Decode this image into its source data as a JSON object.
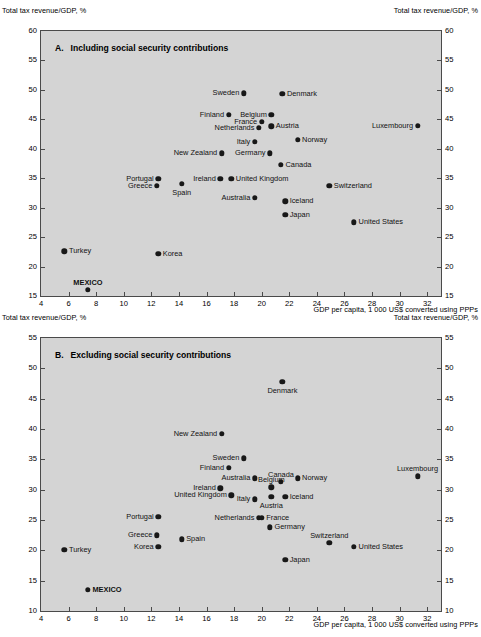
{
  "figure": {
    "y_axis_label": "Total tax revenue/GDP, %",
    "x_axis_label": "GDP per capita, 1 000 US$ converted using PPPs"
  },
  "chart_data": [
    {
      "type": "scatter",
      "panel": "A",
      "panel_letter": "A.",
      "title": "Including social security contributions",
      "xlabel": "GDP per capita, 1 000 US$ converted using PPPs",
      "ylabel": "Total tax revenue/GDP, %",
      "xlim": [
        4,
        33
      ],
      "ylim": [
        15,
        60
      ],
      "xticks": [
        4,
        6,
        8,
        10,
        12,
        14,
        16,
        18,
        20,
        22,
        24,
        26,
        28,
        30,
        32
      ],
      "yticks": [
        15,
        20,
        25,
        30,
        35,
        40,
        45,
        50,
        55,
        60
      ],
      "grid": false,
      "legend": "none",
      "points": [
        {
          "name": "Sweden",
          "x": 18.7,
          "y": 49.4,
          "label_side": "left"
        },
        {
          "name": "Denmark",
          "x": 21.5,
          "y": 49.3,
          "label_side": "right"
        },
        {
          "name": "Finland",
          "x": 17.6,
          "y": 45.8,
          "label_side": "left"
        },
        {
          "name": "Belgium",
          "x": 20.7,
          "y": 45.8,
          "label_side": "left"
        },
        {
          "name": "France",
          "x": 20.0,
          "y": 44.6,
          "label_side": "left"
        },
        {
          "name": "Netherlands",
          "x": 19.8,
          "y": 43.6,
          "label_side": "left"
        },
        {
          "name": "Austria",
          "x": 20.7,
          "y": 43.8,
          "label_side": "right"
        },
        {
          "name": "Luxembourg",
          "x": 31.3,
          "y": 43.9,
          "label_side": "left"
        },
        {
          "name": "Italy",
          "x": 19.5,
          "y": 41.2,
          "label_side": "left"
        },
        {
          "name": "Norway",
          "x": 22.6,
          "y": 41.5,
          "label_side": "right"
        },
        {
          "name": "New Zealand",
          "x": 17.1,
          "y": 39.2,
          "label_side": "left"
        },
        {
          "name": "Germany",
          "x": 20.6,
          "y": 39.2,
          "label_side": "left"
        },
        {
          "name": "Canada",
          "x": 21.4,
          "y": 37.3,
          "label_side": "right"
        },
        {
          "name": "Portugal",
          "x": 12.5,
          "y": 34.9,
          "label_side": "left"
        },
        {
          "name": "Ireland",
          "x": 17.0,
          "y": 34.9,
          "label_side": "left"
        },
        {
          "name": "United Kingdom",
          "x": 17.8,
          "y": 34.9,
          "label_side": "right"
        },
        {
          "name": "Greece",
          "x": 12.4,
          "y": 33.7,
          "label_side": "left"
        },
        {
          "name": "Spain",
          "x": 14.2,
          "y": 34.1,
          "label_side": "below"
        },
        {
          "name": "Switzerland",
          "x": 24.9,
          "y": 33.7,
          "label_side": "right"
        },
        {
          "name": "Australia",
          "x": 19.5,
          "y": 31.7,
          "label_side": "left"
        },
        {
          "name": "Iceland",
          "x": 21.7,
          "y": 31.1,
          "label_side": "right"
        },
        {
          "name": "Japan",
          "x": 21.7,
          "y": 28.8,
          "label_side": "right"
        },
        {
          "name": "United States",
          "x": 26.7,
          "y": 27.5,
          "label_side": "right"
        },
        {
          "name": "Turkey",
          "x": 5.7,
          "y": 22.6,
          "label_side": "right"
        },
        {
          "name": "Korea",
          "x": 12.5,
          "y": 22.2,
          "label_side": "right"
        },
        {
          "name": "MEXICO",
          "x": 7.4,
          "y": 16.1,
          "label_side": "above",
          "bold": true
        }
      ]
    },
    {
      "type": "scatter",
      "panel": "B",
      "panel_letter": "B.",
      "title": "Excluding social security contributions",
      "xlabel": "GDP per capita, 1 000 US$ converted using PPPs",
      "ylabel": "Total tax revenue/GDP, %",
      "xlim": [
        4,
        33
      ],
      "ylim": [
        10,
        55
      ],
      "xticks": [
        4,
        6,
        8,
        10,
        12,
        14,
        16,
        18,
        20,
        22,
        24,
        26,
        28,
        30,
        32
      ],
      "yticks": [
        10,
        15,
        20,
        25,
        30,
        35,
        40,
        45,
        50,
        55
      ],
      "grid": false,
      "legend": "none",
      "points": [
        {
          "name": "Denmark",
          "x": 21.5,
          "y": 47.8,
          "label_side": "below"
        },
        {
          "name": "New Zealand",
          "x": 17.1,
          "y": 39.2,
          "label_side": "left"
        },
        {
          "name": "Sweden",
          "x": 18.7,
          "y": 35.2,
          "label_side": "left"
        },
        {
          "name": "Finland",
          "x": 17.6,
          "y": 33.6,
          "label_side": "left"
        },
        {
          "name": "Luxembourg",
          "x": 31.3,
          "y": 32.2,
          "label_side": "above"
        },
        {
          "name": "Australia",
          "x": 19.5,
          "y": 31.9,
          "label_side": "left"
        },
        {
          "name": "Canada",
          "x": 21.4,
          "y": 31.3,
          "label_side": "above"
        },
        {
          "name": "Norway",
          "x": 22.6,
          "y": 31.9,
          "label_side": "right"
        },
        {
          "name": "Ireland",
          "x": 17.0,
          "y": 30.2,
          "label_side": "left"
        },
        {
          "name": "Belgium",
          "x": 20.7,
          "y": 30.4,
          "label_side": "above"
        },
        {
          "name": "United Kingdom",
          "x": 17.8,
          "y": 29.1,
          "label_side": "left"
        },
        {
          "name": "Italy",
          "x": 19.5,
          "y": 28.4,
          "label_side": "left"
        },
        {
          "name": "Austria",
          "x": 20.7,
          "y": 28.8,
          "label_side": "below"
        },
        {
          "name": "Iceland",
          "x": 21.7,
          "y": 28.8,
          "label_side": "right"
        },
        {
          "name": "Portugal",
          "x": 12.5,
          "y": 25.5,
          "label_side": "left"
        },
        {
          "name": "Netherlands",
          "x": 19.8,
          "y": 25.4,
          "label_side": "left"
        },
        {
          "name": "France",
          "x": 20.0,
          "y": 25.4,
          "label_side": "right"
        },
        {
          "name": "Germany",
          "x": 20.6,
          "y": 23.8,
          "label_side": "right"
        },
        {
          "name": "Greece",
          "x": 12.4,
          "y": 22.5,
          "label_side": "left"
        },
        {
          "name": "Spain",
          "x": 14.2,
          "y": 21.8,
          "label_side": "right"
        },
        {
          "name": "Switzerland",
          "x": 24.9,
          "y": 21.2,
          "label_side": "above"
        },
        {
          "name": "Korea",
          "x": 12.5,
          "y": 20.6,
          "label_side": "left"
        },
        {
          "name": "United States",
          "x": 26.7,
          "y": 20.6,
          "label_side": "right"
        },
        {
          "name": "Turkey",
          "x": 5.7,
          "y": 20.1,
          "label_side": "right"
        },
        {
          "name": "Japan",
          "x": 21.7,
          "y": 18.4,
          "label_side": "right"
        },
        {
          "name": "MEXICO",
          "x": 7.4,
          "y": 13.5,
          "label_side": "right",
          "bold": true
        }
      ]
    }
  ]
}
